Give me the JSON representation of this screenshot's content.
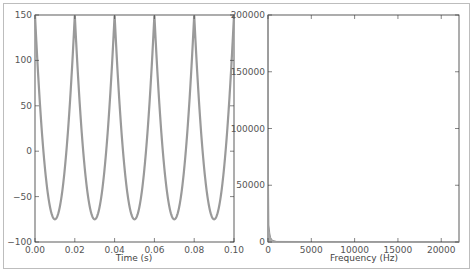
{
  "chart_data": [
    {
      "type": "line",
      "title": "",
      "xlabel": "Time (s)",
      "ylabel": "",
      "xlim": [
        0.0,
        0.1
      ],
      "ylim": [
        -100,
        150
      ],
      "xticks": [
        "0.00",
        "0.02",
        "0.04",
        "0.06",
        "0.08",
        "0.10"
      ],
      "yticks": [
        "150",
        "100",
        "50",
        "0",
        "-50",
        "-100"
      ],
      "grid": false,
      "series": [
        {
          "name": "signal",
          "color": "#999999",
          "description": "periodic waveform, period 0.02 s, peaks at 150, minima about -75",
          "x": [
            0.0,
            0.01,
            0.02,
            0.03,
            0.04,
            0.05,
            0.06,
            0.07,
            0.08,
            0.09,
            0.1
          ],
          "y": [
            150,
            -75,
            150,
            -75,
            150,
            -75,
            150,
            -75,
            150,
            -75,
            150
          ]
        }
      ]
    },
    {
      "type": "line",
      "title": "",
      "xlabel": "Frequency (Hz)",
      "ylabel": "",
      "xlim": [
        0,
        22050
      ],
      "ylim": [
        0,
        200000
      ],
      "xticks": [
        "0",
        "5000",
        "10000",
        "15000",
        "20000"
      ],
      "yticks": [
        "200000",
        "150000",
        "100000",
        "50000",
        "0"
      ],
      "grid": false,
      "series": [
        {
          "name": "spectrum",
          "color": "#999999",
          "description": "large spike near 0 Hz reaching ~200000, decaying to ~0 by ~500 Hz",
          "x": [
            0,
            50,
            100,
            200,
            300,
            500,
            1000,
            22050
          ],
          "y": [
            200000,
            60000,
            15000,
            8000,
            4000,
            1500,
            500,
            0
          ]
        }
      ]
    }
  ]
}
